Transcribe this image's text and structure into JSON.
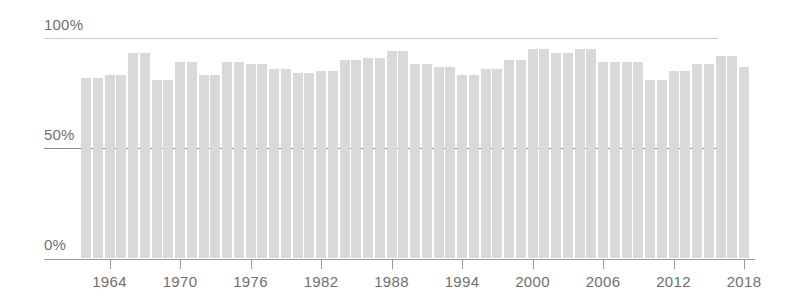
{
  "chart_data": {
    "type": "bar",
    "title": "",
    "subtitle": "",
    "xlabel": "",
    "ylabel": "",
    "ylim": [
      0,
      100
    ],
    "yticks": [
      0,
      50,
      100
    ],
    "ytick_labels": [
      "0%",
      "50%",
      "100%"
    ],
    "grid": true,
    "grid_axis": "y",
    "legend": "none",
    "bar_color": "#d9d9d9",
    "gridline_color": "#c9c9c9",
    "major_gridline_color": "#8a8a8a",
    "axis_color": "#9a9a9a",
    "text_color": "#6f6f6f",
    "xtick_labels": [
      "1964",
      "1970",
      "1976",
      "1982",
      "1988",
      "1994",
      "2000",
      "2006",
      "2012",
      "2018"
    ],
    "xticks": [
      1964,
      1970,
      1976,
      1982,
      1988,
      1994,
      2000,
      2006,
      2012,
      2018
    ],
    "categories": [
      1962,
      1963,
      1964,
      1965,
      1966,
      1967,
      1968,
      1969,
      1970,
      1971,
      1972,
      1973,
      1974,
      1975,
      1976,
      1977,
      1978,
      1979,
      1980,
      1981,
      1982,
      1983,
      1984,
      1985,
      1986,
      1987,
      1988,
      1989,
      1990,
      1991,
      1992,
      1993,
      1994,
      1995,
      1996,
      1997,
      1998,
      1999,
      2000,
      2001,
      2002,
      2003,
      2004,
      2005,
      2006,
      2007,
      2008,
      2009,
      2010,
      2011,
      2012,
      2013,
      2014,
      2015,
      2016,
      2017,
      2018
    ],
    "values": [
      82,
      82,
      83,
      83,
      93,
      93,
      81,
      81,
      89,
      89,
      83,
      83,
      89,
      89,
      88,
      88,
      86,
      86,
      84,
      84,
      85,
      85,
      90,
      90,
      91,
      91,
      94,
      94,
      88,
      88,
      87,
      87,
      83,
      83,
      86,
      86,
      90,
      90,
      95,
      95,
      93,
      93,
      95,
      95,
      89,
      89,
      89,
      89,
      81,
      81,
      85,
      85,
      88,
      88,
      92,
      92,
      87
    ]
  }
}
